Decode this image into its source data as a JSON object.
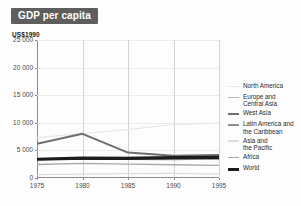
{
  "title": {
    "text": "GDP per capita"
  },
  "unit_label": "US$1990",
  "legend": {
    "items": [
      {
        "label": "North America",
        "color": "#e8e8e8",
        "thickness": 1.3
      },
      {
        "label": "Europe and\nCentral Asia",
        "color": "#b9b9b9",
        "thickness": 1.3
      },
      {
        "label": "West Asia",
        "color": "#6e6e6e",
        "thickness": 2.0
      },
      {
        "label": "Latin America and\nthe Caribbean",
        "color": "#8f8f8f",
        "thickness": 1.6
      },
      {
        "label": "Asia and\nthe Pacific",
        "color": "#dcdcdc",
        "thickness": 1.2
      },
      {
        "label": "Africa",
        "color": "#a8a8a8",
        "thickness": 1.3
      },
      {
        "label": "World",
        "color": "#1c1c1c",
        "thickness": 3.2
      }
    ]
  },
  "chart_data": {
    "type": "line",
    "title": "GDP per capita",
    "xlabel": "",
    "ylabel": "US$1990",
    "x": [
      1975,
      1980,
      1985,
      1990,
      1995
    ],
    "xlim": [
      1975,
      1995
    ],
    "ylim": [
      0,
      25000
    ],
    "yticks": [
      0,
      5000,
      10000,
      15000,
      20000,
      25000
    ],
    "ytick_labels": [
      "0",
      "5 000",
      "10 000",
      "15 000",
      "20 000",
      "25 000"
    ],
    "xtick_labels": [
      "1975",
      "1980",
      "1985",
      "1990",
      "1995"
    ],
    "grid": "vertical",
    "legend_position": "right",
    "series": [
      {
        "name": "North America",
        "values": [
          7300,
          8050,
          8750,
          9700,
          9950
        ]
      },
      {
        "name": "Europe and Central Asia",
        "values": [
          3450,
          3700,
          3750,
          3800,
          3350
        ]
      },
      {
        "name": "West Asia",
        "values": [
          6200,
          8000,
          4600,
          4050,
          4150
        ]
      },
      {
        "name": "Latin America and the Caribbean",
        "values": [
          3300,
          3600,
          3400,
          3350,
          3500
        ]
      },
      {
        "name": "Asia and the Pacific",
        "values": [
          620,
          700,
          780,
          820,
          700
        ]
      },
      {
        "name": "Africa",
        "values": [
          2450,
          2650,
          2500,
          2400,
          2300
        ]
      },
      {
        "name": "World",
        "values": [
          3400,
          3600,
          3550,
          3700,
          3750
        ]
      }
    ]
  }
}
